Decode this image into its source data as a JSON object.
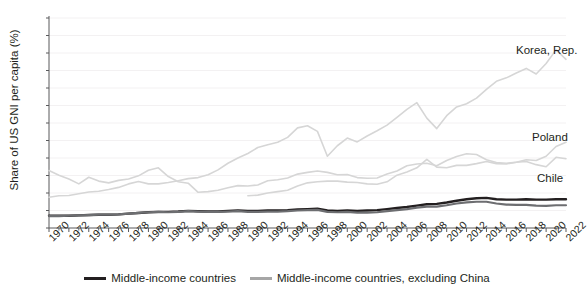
{
  "chart_data": {
    "type": "line",
    "title": "",
    "xlabel": "",
    "ylabel": "Share of US GNI per capita (%)",
    "ylim": [
      0,
      60
    ],
    "ytick_step": 5,
    "yticks": [
      0,
      5,
      10,
      15,
      20,
      25,
      30,
      35,
      40,
      45,
      50,
      55,
      60
    ],
    "xlim": [
      1970,
      2022
    ],
    "xticks": [
      1970,
      1972,
      1974,
      1976,
      1978,
      1980,
      1982,
      1984,
      1986,
      1988,
      1990,
      1992,
      1994,
      1996,
      1998,
      2000,
      2002,
      2004,
      2006,
      2008,
      2010,
      2012,
      2014,
      2016,
      2018,
      2020,
      2022
    ],
    "grid": "horizontal-faint",
    "legend_position": "bottom-center",
    "x": [
      1970,
      1971,
      1972,
      1973,
      1974,
      1975,
      1976,
      1977,
      1978,
      1979,
      1980,
      1981,
      1982,
      1983,
      1984,
      1985,
      1986,
      1987,
      1988,
      1989,
      1990,
      1991,
      1992,
      1993,
      1994,
      1995,
      1996,
      1997,
      1998,
      1999,
      2000,
      2001,
      2002,
      2003,
      2004,
      2005,
      2006,
      2007,
      2008,
      2009,
      2010,
      2011,
      2012,
      2013,
      2014,
      2015,
      2016,
      2017,
      2018,
      2019,
      2020,
      2021,
      2022
    ],
    "series": [
      {
        "name": "Middle-income countries",
        "color": "#231f20",
        "width": 2.4,
        "labelled_on_plot": false,
        "values": [
          3.5,
          3.5,
          3.5,
          3.6,
          3.7,
          3.8,
          3.8,
          3.9,
          4.1,
          4.3,
          4.5,
          4.6,
          4.6,
          4.7,
          4.9,
          4.8,
          4.7,
          4.7,
          4.9,
          5.0,
          4.9,
          4.9,
          5.0,
          5.0,
          5.1,
          5.3,
          5.4,
          5.5,
          5.0,
          4.9,
          5.0,
          4.9,
          5.0,
          5.1,
          5.4,
          5.7,
          6.0,
          6.4,
          6.8,
          6.9,
          7.3,
          7.8,
          8.2,
          8.5,
          8.6,
          8.2,
          8.1,
          8.1,
          8.2,
          8.1,
          8.1,
          8.2,
          8.2
        ]
      },
      {
        "name": "Middle-income countries, excluding China",
        "color": "#6d6e71",
        "width": 2.2,
        "labelled_on_plot": false,
        "values": [
          3.4,
          3.4,
          3.5,
          3.6,
          3.7,
          3.8,
          3.8,
          3.9,
          4.1,
          4.3,
          4.5,
          4.6,
          4.5,
          4.6,
          4.8,
          4.7,
          4.6,
          4.6,
          4.7,
          4.8,
          4.6,
          4.6,
          4.7,
          4.7,
          4.8,
          5.0,
          5.1,
          5.2,
          4.6,
          4.5,
          4.6,
          4.4,
          4.4,
          4.5,
          4.8,
          5.1,
          5.4,
          5.8,
          6.1,
          6.1,
          6.5,
          7.0,
          7.3,
          7.5,
          7.5,
          7.0,
          6.7,
          6.6,
          6.6,
          6.4,
          6.3,
          6.5,
          6.5
        ]
      },
      {
        "name": "Korea, Rep.",
        "color": "#d6d6d6",
        "width": 1.6,
        "labelled_on_plot": true,
        "label_x": 516,
        "label_y": 44,
        "values": [
          8.8,
          9.2,
          9.3,
          9.8,
          10.3,
          10.5,
          11.0,
          11.6,
          12.6,
          13.3,
          12.6,
          12.6,
          13.0,
          13.5,
          14.1,
          14.4,
          15.2,
          16.6,
          18.5,
          20.0,
          21.3,
          23.0,
          23.8,
          24.5,
          25.9,
          28.6,
          29.2,
          27.6,
          20.5,
          23.5,
          25.7,
          24.6,
          26.3,
          27.8,
          29.4,
          31.6,
          33.9,
          35.8,
          31.4,
          28.4,
          32.1,
          34.6,
          35.5,
          37.1,
          39.6,
          41.9,
          42.9,
          44.3,
          45.6,
          44.0,
          47.0,
          50.9,
          48.2
        ]
      },
      {
        "name": "Poland",
        "color": "#d6d6d6",
        "width": 1.6,
        "labelled_on_plot": true,
        "label_x": 532,
        "label_y": 131,
        "values": [
          null,
          null,
          null,
          null,
          null,
          null,
          null,
          null,
          null,
          null,
          null,
          null,
          null,
          null,
          null,
          null,
          null,
          null,
          null,
          null,
          9.2,
          9.4,
          10.0,
          10.4,
          10.8,
          12.0,
          12.9,
          13.2,
          13.4,
          13.4,
          13.1,
          13.0,
          12.6,
          12.5,
          13.2,
          15.1,
          16.0,
          17.2,
          19.6,
          17.4,
          17.2,
          17.9,
          17.9,
          18.4,
          19.0,
          18.4,
          18.3,
          18.8,
          19.5,
          19.3,
          20.5,
          23.3,
          24.5
        ]
      },
      {
        "name": "Chile",
        "color": "#d6d6d6",
        "width": 1.6,
        "labelled_on_plot": true,
        "label_x": 537,
        "label_y": 172,
        "values": [
          16.4,
          15.1,
          14.0,
          12.6,
          14.5,
          13.4,
          12.9,
          13.6,
          14.0,
          14.9,
          16.5,
          17.2,
          14.7,
          13.2,
          12.8,
          10.2,
          10.4,
          10.8,
          11.5,
          12.1,
          12.0,
          12.3,
          13.5,
          13.8,
          14.3,
          15.4,
          15.9,
          16.3,
          15.9,
          15.2,
          15.3,
          14.4,
          14.2,
          14.3,
          15.4,
          16.3,
          17.8,
          18.3,
          18.5,
          17.8,
          19.3,
          20.4,
          21.2,
          21.0,
          19.5,
          18.7,
          18.5,
          18.8,
          19.0,
          18.1,
          17.5,
          20.2,
          19.8
        ]
      }
    ]
  },
  "legend": {
    "items": [
      {
        "label": "Middle-income countries",
        "color": "#231f20"
      },
      {
        "label": "Middle-income countries, excluding China",
        "color": "#a6a6a6"
      }
    ]
  },
  "axis": {
    "y_title": "Share of US GNI per capita (%)"
  }
}
